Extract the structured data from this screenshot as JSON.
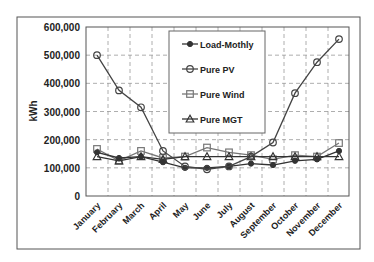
{
  "chart_data": {
    "type": "line",
    "title": "",
    "xlabel": "",
    "ylabel": "kWh",
    "ylim": [
      0,
      600000
    ],
    "yticks": [
      0,
      100000,
      200000,
      300000,
      400000,
      500000,
      600000
    ],
    "ytick_labels": [
      "0",
      "100,000",
      "200,000",
      "300,000",
      "400,000",
      "500,000",
      "600,000"
    ],
    "grid": true,
    "legend_position": "upper center (inside plot)",
    "categories": [
      "January",
      "February",
      "March",
      "April",
      "May",
      "June",
      "July",
      "August",
      "September",
      "October",
      "November",
      "December"
    ],
    "series": [
      {
        "name": "Load-Mothly",
        "marker": "filled-circle",
        "color": "#333333",
        "values": [
          155000,
          135000,
          140000,
          120000,
          100000,
          100000,
          105000,
          115000,
          110000,
          125000,
          130000,
          160000
        ]
      },
      {
        "name": "Pure PV",
        "marker": "open-circle",
        "color": "#444444",
        "values": [
          500000,
          375000,
          315000,
          160000,
          105000,
          95000,
          105000,
          140000,
          190000,
          365000,
          475000,
          557000
        ]
      },
      {
        "name": "Pure Wind",
        "marker": "open-square",
        "color": "#777777",
        "values": [
          167000,
          125000,
          160000,
          135000,
          140000,
          172000,
          155000,
          145000,
          130000,
          145000,
          140000,
          188000
        ]
      },
      {
        "name": "Pure MGT",
        "marker": "open-triangle",
        "color": "#333333",
        "values": [
          140000,
          125000,
          140000,
          130000,
          140000,
          140000,
          140000,
          140000,
          140000,
          140000,
          140000,
          140000
        ]
      }
    ]
  }
}
